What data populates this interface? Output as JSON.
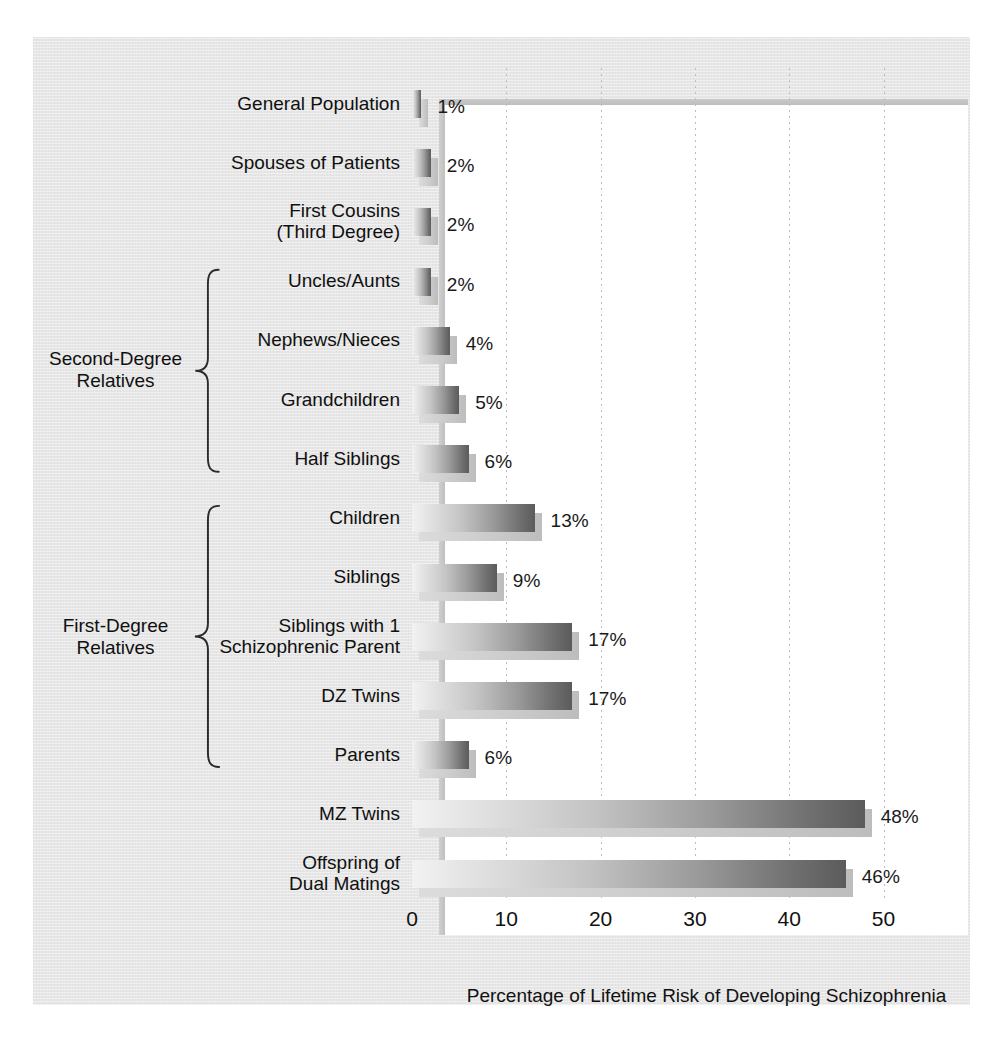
{
  "chart_data": {
    "type": "bar",
    "orientation": "horizontal",
    "title": "",
    "xlabel": "Percentage of Lifetime Risk of Developing Schizophrenia",
    "ylabel": "",
    "xlim": [
      0,
      55
    ],
    "xticks": [
      0,
      10,
      20,
      30,
      40,
      50
    ],
    "xtick_labels": [
      "0",
      "10",
      "20",
      "30",
      "40",
      "50"
    ],
    "grid": "vertical-dotted",
    "legend": "none",
    "value_suffix": "%",
    "categories": [
      "General Population",
      "Spouses of Patients",
      "First Cousins\n(Third Degree)",
      "Uncles/Aunts",
      "Nephews/Nieces",
      "Grandchildren",
      "Half Siblings",
      "Children",
      "Siblings",
      "Siblings with 1\nSchizophrenic Parent",
      "DZ Twins",
      "Parents",
      "MZ Twins",
      "Offspring of\nDual Matings"
    ],
    "values": [
      1,
      2,
      2,
      2,
      4,
      5,
      6,
      13,
      9,
      17,
      17,
      6,
      48,
      46
    ],
    "value_labels": [
      "1%",
      "2%",
      "2%",
      "2%",
      "4%",
      "5%",
      "6%",
      "13%",
      "9%",
      "17%",
      "17%",
      "6%",
      "48%",
      "46%"
    ],
    "groups": [
      {
        "label": "Second-Degree\nRelatives",
        "members": [
          "Uncles/Aunts",
          "Nephews/Nieces",
          "Grandchildren",
          "Half Siblings"
        ]
      },
      {
        "label": "First-Degree\nRelatives",
        "members": [
          "Children",
          "Siblings",
          "Siblings with 1 Schizophrenic Parent",
          "DZ Twins",
          "Parents"
        ]
      }
    ],
    "colors": {
      "bar_light": "#f2f2f2",
      "bar_dark": "#5b5b5b",
      "shadow": "#cfcfcf",
      "plot_background": "#ffffff",
      "figure_background": "#e6e6e6",
      "gridline": "#bdbdbd",
      "text": "#101010"
    }
  }
}
